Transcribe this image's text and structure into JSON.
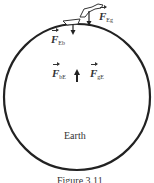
{
  "figure": {
    "body_label": "Earth",
    "caption": "Figure 3.11",
    "forces": [
      {
        "symbol": "F",
        "subscript": "Eg",
        "description": "force of Earth on girl"
      },
      {
        "symbol": "F",
        "subscript": "Eb",
        "description": "force of Earth on board"
      },
      {
        "symbol": "F",
        "subscript": "bE",
        "description": "force of board on Earth"
      },
      {
        "symbol": "F",
        "subscript": "gE",
        "description": "force of girl on Earth"
      }
    ],
    "colors": {
      "stroke": "#222222",
      "text": "#333333",
      "background": "#ffffff"
    }
  }
}
